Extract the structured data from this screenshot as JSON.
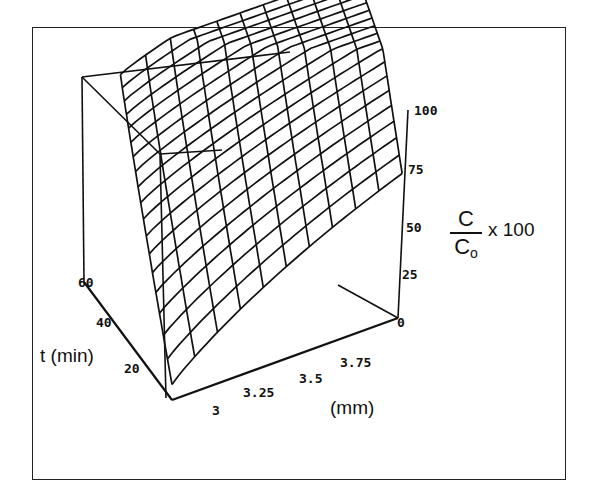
{
  "chart_data": {
    "type": "surface3d",
    "title": "",
    "z_axis": {
      "label_numerator": "C",
      "label_denominator": "C",
      "label_denominator_sub": "o",
      "label_suffix": "x 100",
      "ticks": [
        "0",
        "25",
        "50",
        "75",
        "100"
      ],
      "range": [
        0,
        100
      ]
    },
    "y_axis": {
      "label": "t (min)",
      "ticks": [
        "20",
        "40",
        "60"
      ],
      "range": [
        20,
        60
      ]
    },
    "x_axis": {
      "label": "(mm)",
      "ticks": [
        "3",
        "3.25",
        "3.5",
        "3.75"
      ],
      "range": [
        3,
        3.75
      ]
    },
    "grid": true,
    "legend": null
  },
  "colors": {
    "line": "#111111",
    "background": "#ffffff"
  }
}
